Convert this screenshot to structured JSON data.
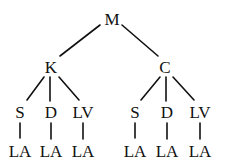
{
  "tree": {
    "root": {
      "id": "n0",
      "label": "M",
      "x": 112,
      "y": 20
    },
    "nodes": [
      {
        "id": "n1",
        "label": "K",
        "x": 52,
        "y": 68
      },
      {
        "id": "n2",
        "label": "C",
        "x": 165,
        "y": 68
      },
      {
        "id": "n3",
        "label": "S",
        "x": 20,
        "y": 113
      },
      {
        "id": "n4",
        "label": "D",
        "x": 51,
        "y": 113
      },
      {
        "id": "n5",
        "label": "LV",
        "x": 83,
        "y": 113
      },
      {
        "id": "n6",
        "label": "S",
        "x": 135,
        "y": 113
      },
      {
        "id": "n7",
        "label": "D",
        "x": 167,
        "y": 113
      },
      {
        "id": "n8",
        "label": "LV",
        "x": 200,
        "y": 113
      },
      {
        "id": "n9",
        "label": "LA",
        "x": 20,
        "y": 152
      },
      {
        "id": "n10",
        "label": "LA",
        "x": 51,
        "y": 152
      },
      {
        "id": "n11",
        "label": "LA",
        "x": 83,
        "y": 152
      },
      {
        "id": "n12",
        "label": "LA",
        "x": 135,
        "y": 152
      },
      {
        "id": "n13",
        "label": "LA",
        "x": 167,
        "y": 152
      },
      {
        "id": "n14",
        "label": "LA",
        "x": 200,
        "y": 152
      }
    ],
    "edges": [
      [
        "n0",
        "n1"
      ],
      [
        "n0",
        "n2"
      ],
      [
        "n1",
        "n3"
      ],
      [
        "n1",
        "n4"
      ],
      [
        "n1",
        "n5"
      ],
      [
        "n2",
        "n6"
      ],
      [
        "n2",
        "n7"
      ],
      [
        "n2",
        "n8"
      ],
      [
        "n3",
        "n9"
      ],
      [
        "n4",
        "n10"
      ],
      [
        "n5",
        "n11"
      ],
      [
        "n6",
        "n12"
      ],
      [
        "n7",
        "n13"
      ],
      [
        "n8",
        "n14"
      ]
    ]
  }
}
